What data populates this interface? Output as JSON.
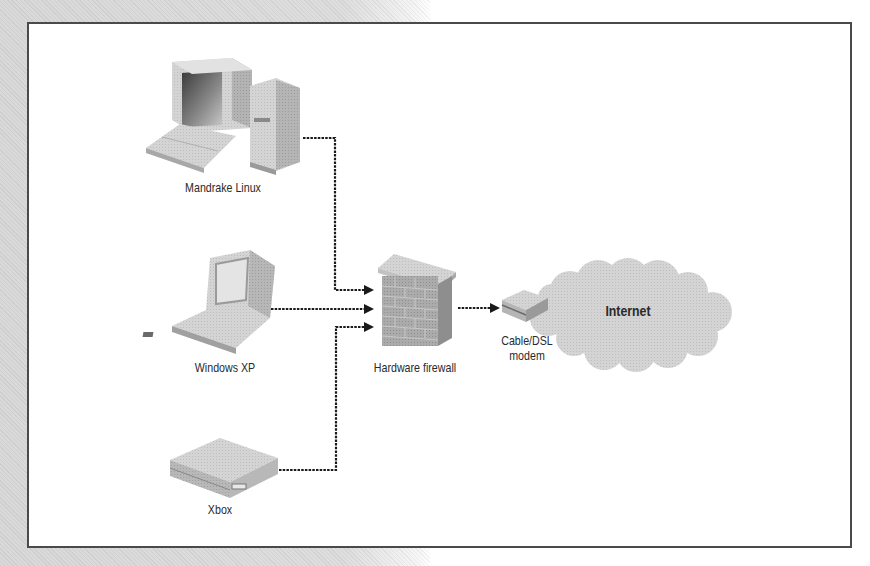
{
  "diagram": {
    "nodes": [
      {
        "id": "mandrake",
        "label": "Mandrake Linux",
        "icon": "desktop-computer-icon"
      },
      {
        "id": "winxp",
        "label": "Windows XP",
        "icon": "laptop-icon"
      },
      {
        "id": "xbox",
        "label": "Xbox",
        "icon": "game-console-icon"
      },
      {
        "id": "firewall",
        "label": "Hardware firewall",
        "icon": "brick-wall-icon"
      },
      {
        "id": "modem",
        "label_line1": "Cable/DSL",
        "label_line2": "modem",
        "icon": "modem-icon"
      },
      {
        "id": "internet",
        "label": "Internet",
        "icon": "cloud-icon"
      }
    ],
    "edges": [
      {
        "from": "mandrake",
        "to": "firewall",
        "style": "dashed",
        "arrow": true
      },
      {
        "from": "winxp",
        "to": "firewall",
        "style": "dashed",
        "arrow": true
      },
      {
        "from": "xbox",
        "to": "firewall",
        "style": "dashed",
        "arrow": true
      },
      {
        "from": "firewall",
        "to": "modem",
        "style": "dashed",
        "arrow": true
      }
    ],
    "colors": {
      "frame": "#4a4a4a",
      "line": "#1a1a1a",
      "device_light": "#d8d8d8",
      "device_dark": "#a8a8a8",
      "brick": "#9a9a9a",
      "cloud": "#dcdcdc"
    }
  }
}
